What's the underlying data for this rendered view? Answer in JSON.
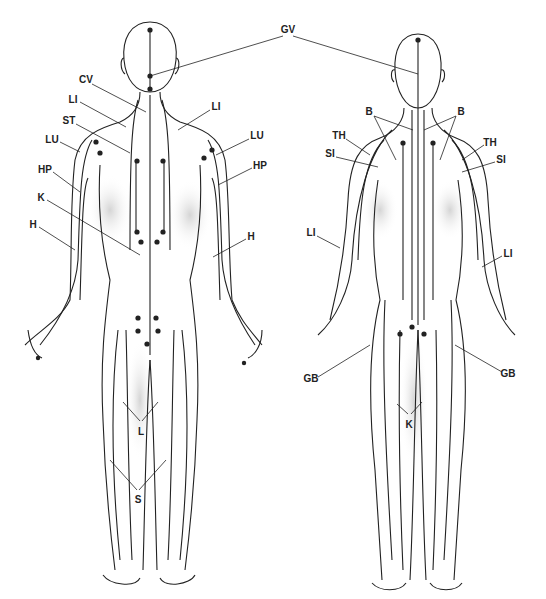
{
  "diagram": {
    "type": "meridian-chart",
    "figures": [
      "front-male-figure",
      "back-female-figure"
    ],
    "labels": [
      {
        "id": "gv",
        "text": "GV",
        "x": 288,
        "y": 30
      },
      {
        "id": "cv",
        "text": "CV",
        "x": 86,
        "y": 80
      },
      {
        "id": "li-front-left",
        "text": "LI",
        "x": 73,
        "y": 100
      },
      {
        "id": "li-front-right",
        "text": "LI",
        "x": 216,
        "y": 107
      },
      {
        "id": "st",
        "text": "ST",
        "x": 69,
        "y": 121
      },
      {
        "id": "lu-left",
        "text": "LU",
        "x": 52,
        "y": 140
      },
      {
        "id": "lu-right",
        "text": "LU",
        "x": 257,
        "y": 136
      },
      {
        "id": "hp-left",
        "text": "HP",
        "x": 45,
        "y": 170
      },
      {
        "id": "hp-right",
        "text": "HP",
        "x": 260,
        "y": 166
      },
      {
        "id": "k-front",
        "text": "K",
        "x": 41,
        "y": 198
      },
      {
        "id": "h-left",
        "text": "H",
        "x": 33,
        "y": 225
      },
      {
        "id": "h-right",
        "text": "H",
        "x": 251,
        "y": 237
      },
      {
        "id": "l",
        "text": "L",
        "x": 141,
        "y": 432
      },
      {
        "id": "s",
        "text": "S",
        "x": 138,
        "y": 500
      },
      {
        "id": "b-left",
        "text": "B",
        "x": 369,
        "y": 112
      },
      {
        "id": "b-right",
        "text": "B",
        "x": 461,
        "y": 112
      },
      {
        "id": "th-left",
        "text": "TH",
        "x": 339,
        "y": 136
      },
      {
        "id": "th-right",
        "text": "TH",
        "x": 490,
        "y": 143
      },
      {
        "id": "si-left",
        "text": "SI",
        "x": 330,
        "y": 154
      },
      {
        "id": "si-right",
        "text": "SI",
        "x": 501,
        "y": 160
      },
      {
        "id": "li-back-left",
        "text": "LI",
        "x": 311,
        "y": 233
      },
      {
        "id": "li-back-right",
        "text": "LI",
        "x": 508,
        "y": 254
      },
      {
        "id": "gb-left",
        "text": "GB",
        "x": 311,
        "y": 379
      },
      {
        "id": "gb-right",
        "text": "GB",
        "x": 508,
        "y": 374
      },
      {
        "id": "k-back",
        "text": "K",
        "x": 409,
        "y": 425
      }
    ],
    "colors": {
      "line": "#222222",
      "shade": "#d8d8d8",
      "background": "#ffffff"
    }
  }
}
